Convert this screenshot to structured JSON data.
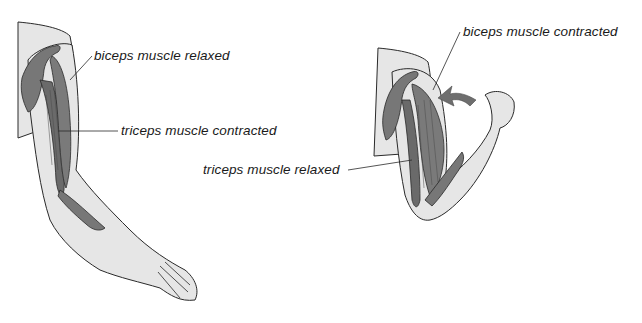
{
  "diagram": {
    "type": "anatomical-illustration",
    "colors": {
      "skin": "#e6e6e6",
      "muscle": "#777777",
      "muscle_dark": "#5e5e5e",
      "outline": "#2a2a2a",
      "arrow": "#6e6e6e",
      "background": "#ffffff"
    },
    "figures": [
      {
        "id": "arm-extended",
        "labels": [
          {
            "text": "biceps muscle relaxed"
          },
          {
            "text": "triceps muscle contracted"
          }
        ]
      },
      {
        "id": "arm-flexed",
        "labels": [
          {
            "text": "biceps muscle contracted"
          },
          {
            "text": "triceps muscle relaxed"
          }
        ],
        "arrow": "curved-arrow-flexion"
      }
    ]
  }
}
